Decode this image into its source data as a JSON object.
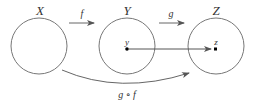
{
  "diagram": {
    "sets": [
      {
        "id": "X",
        "label": "X",
        "cx": 39,
        "cy": 46,
        "r": 28
      },
      {
        "id": "Y",
        "label": "Y",
        "cx": 127,
        "cy": 46,
        "r": 28
      },
      {
        "id": "Z",
        "label": "Z",
        "cx": 216,
        "cy": 46,
        "r": 28
      }
    ],
    "arrows": [
      {
        "id": "f",
        "label": "f",
        "from": "X",
        "to": "Y"
      },
      {
        "id": "g",
        "label": "g",
        "from": "Y",
        "to": "Z"
      },
      {
        "id": "gof",
        "label": "g ∘ f",
        "from": "X",
        "to": "Z",
        "curved": true
      }
    ],
    "points": [
      {
        "id": "y",
        "label": "y",
        "set": "Y"
      },
      {
        "id": "z",
        "label": "z",
        "set": "Z"
      }
    ],
    "mapping_arrow": {
      "from": "y",
      "to": "z"
    },
    "colors": {
      "stroke": "#666666",
      "text": "#333333",
      "point": "#000000"
    }
  }
}
